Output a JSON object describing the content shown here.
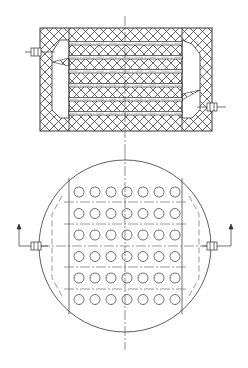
{
  "diagram": {
    "type": "technical-drawing",
    "views": [
      {
        "name": "section-view",
        "description": "Rectangular hatched block with six horizontal channels and two side nozzles"
      },
      {
        "name": "plan-view",
        "description": "Circular vessel with 7 x 6 grid of holes and two side nozzles with upward arrows"
      }
    ],
    "section_view": {
      "outer": {
        "x": 40,
        "y": 28,
        "w": 172,
        "h": 103
      },
      "core": {
        "x": 69,
        "x2": 182
      },
      "channel_rows_y": [
        43,
        57,
        71,
        85,
        99,
        113
      ],
      "nozzle_left": {
        "x": 30,
        "y": 52
      },
      "nozzle_right": {
        "x": 208,
        "y": 107
      }
    },
    "plan_view": {
      "circle": {
        "cx": 125,
        "cy": 246,
        "r": 86
      },
      "hole_grid": {
        "columns": 7,
        "rows": 6,
        "x0": 79,
        "dx": 16,
        "y0": 192,
        "dy": 21.5,
        "r": 5
      },
      "nozzle_left": {
        "x": 35,
        "y": 246
      },
      "nozzle_right": {
        "x": 213,
        "y": 246
      }
    },
    "caption": ""
  },
  "colors": {
    "line": "#333333",
    "hatch": "#555555",
    "background": "#ffffff"
  }
}
